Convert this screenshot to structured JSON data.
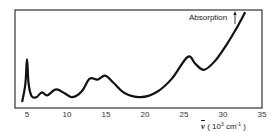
{
  "chart_data": {
    "type": "line",
    "title": "",
    "xlabel": "ν̄ (10³ cm⁻¹)",
    "ylabel": "Absorption",
    "xlim": [
      4,
      35
    ],
    "ylim": [
      0,
      1
    ],
    "x_ticks": [
      5,
      10,
      15,
      20,
      25,
      30,
      35
    ],
    "grid": false,
    "legend": null,
    "series": [
      {
        "name": "Absorption",
        "x": [
          4.4,
          4.8,
          5.0,
          5.2,
          5.6,
          6.2,
          6.9,
          7.6,
          8.7,
          9.8,
          10.8,
          12.0,
          13.0,
          14.0,
          15.0,
          16.0,
          17.5,
          19.5,
          21.5,
          23.5,
          25.5,
          26.5,
          27.6,
          29.0,
          30.5,
          32.0,
          32.8
        ],
        "values": [
          0.07,
          0.25,
          0.5,
          0.25,
          0.12,
          0.11,
          0.16,
          0.13,
          0.19,
          0.15,
          0.11,
          0.17,
          0.3,
          0.29,
          0.33,
          0.26,
          0.15,
          0.11,
          0.16,
          0.3,
          0.52,
          0.45,
          0.39,
          0.48,
          0.65,
          0.85,
          0.97
        ]
      }
    ]
  },
  "axis": {
    "ticks": [
      "5",
      "10",
      "15",
      "20",
      "25",
      "30",
      "35"
    ],
    "ylabel": "Absorption",
    "ylabel_arrow": "↑",
    "xlabel_symbol": "ν",
    "xlabel_unit_pre": " ( 10",
    "xlabel_exp": "3",
    "xlabel_unit_post": " cm",
    "xlabel_exp2": "-1",
    "xlabel_close": " )"
  },
  "colors": {
    "line": "#111111",
    "frame": "#333333"
  }
}
